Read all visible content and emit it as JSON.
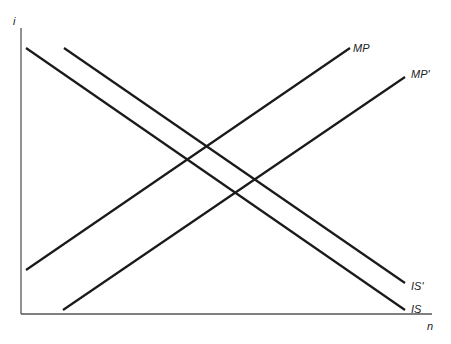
{
  "diagram": {
    "axes": {
      "y_label": "i",
      "x_label": "n",
      "origin": [
        21,
        314
      ],
      "y_top": 28,
      "x_right": 432
    },
    "curves": [
      {
        "id": "is",
        "label": "IS",
        "x1": 26,
        "y1": 48,
        "x2": 405,
        "y2": 310,
        "label_x": 411,
        "label_y": 313
      },
      {
        "id": "is-prime",
        "label": "IS'",
        "x1": 64,
        "y1": 48,
        "x2": 405,
        "y2": 283,
        "label_x": 411,
        "label_y": 290
      },
      {
        "id": "mp",
        "label": "MP",
        "x1": 26,
        "y1": 270,
        "x2": 350,
        "y2": 48,
        "label_x": 353,
        "label_y": 52
      },
      {
        "id": "mp-prime",
        "label": "MP'",
        "x1": 63,
        "y1": 310,
        "x2": 405,
        "y2": 77,
        "label_x": 411,
        "label_y": 78
      }
    ],
    "colors": {
      "curve": "#1a1a1a",
      "axis": "#555555",
      "background": "#ffffff"
    }
  }
}
